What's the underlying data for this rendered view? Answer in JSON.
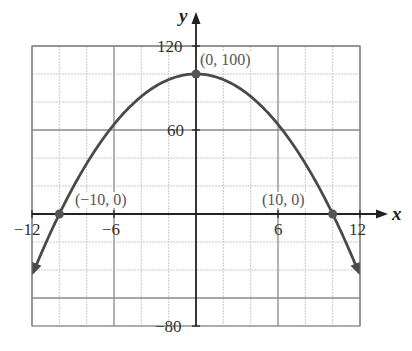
{
  "chart_data": {
    "type": "line",
    "title": "",
    "xlabel": "x",
    "ylabel": "y",
    "xlim": [
      -12,
      12
    ],
    "ylim": [
      -80,
      120
    ],
    "grid": true,
    "x_ticks": [
      {
        "value": -12,
        "label": "−12"
      },
      {
        "value": -6,
        "label": "−6"
      },
      {
        "value": 6,
        "label": "6"
      },
      {
        "value": 12,
        "label": "12"
      }
    ],
    "y_ticks": [
      {
        "value": 120,
        "label": "120"
      },
      {
        "value": 60,
        "label": "60"
      },
      {
        "value": -80,
        "label": "−80"
      }
    ],
    "series": [
      {
        "name": "y = 100 − x²",
        "function": "100 - x^2",
        "x_range": [
          -11.7,
          11.7
        ],
        "color": "#4a4a4a"
      }
    ],
    "points": [
      {
        "x": 0,
        "y": 100,
        "label": "(0, 100)"
      },
      {
        "x": -10,
        "y": 0,
        "label": "(−10, 0)"
      },
      {
        "x": 10,
        "y": 0,
        "label": "(10, 0)"
      }
    ]
  }
}
